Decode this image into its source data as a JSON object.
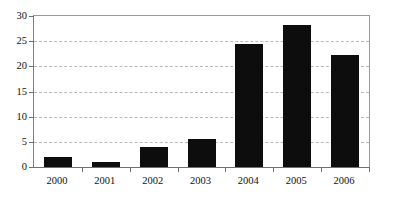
{
  "chart_data": {
    "type": "bar",
    "title": "",
    "subtitle": "",
    "xlabel": "",
    "ylabel": "",
    "categories": [
      "2000",
      "2001",
      "2002",
      "2003",
      "2004",
      "2005",
      "2006"
    ],
    "values": [
      2.0,
      0.9,
      3.9,
      5.6,
      24.5,
      28.3,
      22.2
    ],
    "ylim": [
      0,
      30
    ],
    "yticks": [
      0,
      5,
      10,
      15,
      20,
      25,
      30
    ],
    "ytick_labels": [
      "0",
      "5",
      "10",
      "15",
      "20",
      "25",
      "30"
    ],
    "grid": true,
    "grid_axis": "y",
    "grid_style": "dashed",
    "legend": false,
    "legend_position": "none",
    "bar_color": "#0d0d0d",
    "grid_color": "#b9b9b9",
    "axis_color": "#6f6f6f",
    "frame_color": "#9a9a9a",
    "background_color": "#ffffff",
    "text_color": "#111111"
  }
}
